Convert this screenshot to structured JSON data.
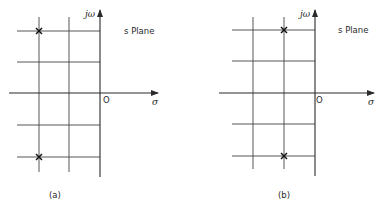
{
  "figure": {
    "panels": [
      {
        "id": "a",
        "caption": "(a)",
        "plane_label": "s Plane",
        "imag_axis_label": "jω",
        "real_axis_label": "σ",
        "origin_label": "O",
        "poles": [
          {
            "sigma": -2,
            "omega": 2,
            "marker": "×"
          },
          {
            "sigma": -2,
            "omega": -2,
            "marker": "×"
          }
        ]
      },
      {
        "id": "b",
        "caption": "(b)",
        "plane_label": "s Plane",
        "imag_axis_label": "jω",
        "real_axis_label": "σ",
        "origin_label": "O",
        "poles": [
          {
            "sigma": -1,
            "omega": 2,
            "marker": "×"
          },
          {
            "sigma": -1,
            "omega": -2,
            "marker": "×"
          }
        ]
      }
    ],
    "grid": {
      "columns_left_of_axis": 2,
      "rows_above_axis": 2,
      "rows_below_axis": 2
    },
    "colors": {
      "ink": "#2a2a2a",
      "background": "#ffffff"
    }
  }
}
